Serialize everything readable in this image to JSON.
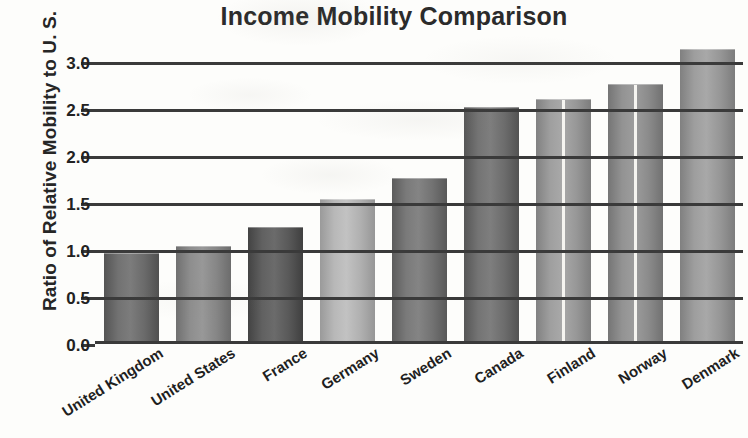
{
  "chart_data": {
    "type": "bar",
    "title": "Income Mobility Comparison",
    "xlabel": "",
    "ylabel": "Ratio of Relative Mobility to U. S.",
    "categories": [
      "United Kingdom",
      "United States",
      "France",
      "Germany",
      "Sweden",
      "Canada",
      "Finland",
      "Norway",
      "Denmark"
    ],
    "values": [
      0.93,
      1.0,
      1.2,
      1.5,
      1.72,
      2.48,
      2.56,
      2.72,
      3.1
    ],
    "ylim": [
      0.0,
      3.25
    ],
    "yticks": [
      "0.0",
      "0.5",
      "1.0",
      "1.5",
      "2.0",
      "2.5",
      "3.0"
    ],
    "ytick_values": [
      0.0,
      0.5,
      1.0,
      1.5,
      2.0,
      2.5,
      3.0
    ],
    "grid": true,
    "legend": "none",
    "bar_colors": [
      "#6e6e6e",
      "#8a8a8a",
      "#5d5d5d",
      "#b4b4b4",
      "#767676",
      "#707070",
      "#9b9b9b",
      "#8f8f8f",
      "#9a9a9a"
    ],
    "label_rotation": -32
  },
  "axis": {
    "y_title": "Ratio of Relative Mobility to U. S."
  },
  "title": {
    "text": "Income Mobility Comparison"
  }
}
